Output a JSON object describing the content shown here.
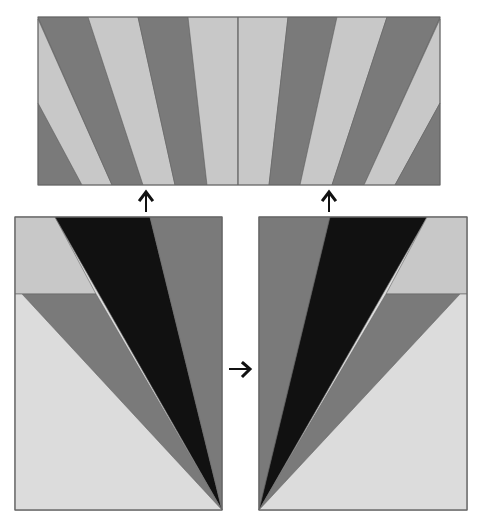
{
  "figure": {
    "colors": {
      "light": "#c8c8c8",
      "lighter": "#dcdcdc",
      "medium": "#7a7a7a",
      "dark": "#111111",
      "outline": "#666666",
      "arrow": "#111111"
    },
    "top_panel": {
      "name": "assembled-starburst-panel",
      "stripe_count": 12,
      "stripe_pattern": [
        "medium",
        "light",
        "medium",
        "light",
        "medium",
        "light",
        "light",
        "medium",
        "light",
        "medium",
        "light",
        "medium"
      ]
    },
    "left_unit": {
      "name": "left-blade-unit",
      "wedges": [
        "light",
        "dark",
        "medium",
        "medium",
        "lighter"
      ]
    },
    "right_unit": {
      "name": "right-blade-unit",
      "wedges": [
        "medium",
        "dark",
        "light",
        "medium",
        "lighter"
      ]
    },
    "arrows": [
      {
        "name": "up-arrow-left",
        "direction": "up"
      },
      {
        "name": "up-arrow-right",
        "direction": "up"
      },
      {
        "name": "right-arrow-middle",
        "direction": "right"
      }
    ]
  }
}
